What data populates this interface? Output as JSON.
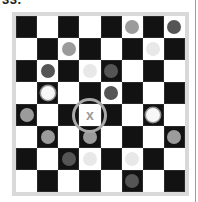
{
  "puzzle": {
    "title": "33.",
    "target_mark": "x",
    "target_cell": {
      "row": 4,
      "col": 3
    }
  },
  "colors": {
    "dark_square": "#121212",
    "light_square": "#ffffff",
    "frame": "#d9d9d9",
    "piece_mid_gray": "#9b9b9b",
    "piece_dark_gray": "#555555",
    "piece_light_gray": "#e8e8e8",
    "piece_white": "#f7f7f7",
    "target_ring": "#a9a9a9"
  },
  "board": {
    "rows": 8,
    "cols": 8,
    "pieces": [
      {
        "row": 0,
        "col": 5,
        "type": "mid"
      },
      {
        "row": 0,
        "col": 7,
        "type": "darkp"
      },
      {
        "row": 1,
        "col": 2,
        "type": "mid"
      },
      {
        "row": 1,
        "col": 6,
        "type": "lightp"
      },
      {
        "row": 2,
        "col": 1,
        "type": "darkp"
      },
      {
        "row": 2,
        "col": 3,
        "type": "lightp"
      },
      {
        "row": 2,
        "col": 4,
        "type": "darkp"
      },
      {
        "row": 3,
        "col": 1,
        "type": "white"
      },
      {
        "row": 3,
        "col": 4,
        "type": "darkp"
      },
      {
        "row": 4,
        "col": 0,
        "type": "mid"
      },
      {
        "row": 4,
        "col": 6,
        "type": "white"
      },
      {
        "row": 5,
        "col": 1,
        "type": "mid"
      },
      {
        "row": 5,
        "col": 3,
        "type": "mid"
      },
      {
        "row": 5,
        "col": 7,
        "type": "mid"
      },
      {
        "row": 6,
        "col": 2,
        "type": "darkp"
      },
      {
        "row": 6,
        "col": 3,
        "type": "lightp"
      },
      {
        "row": 6,
        "col": 5,
        "type": "lightp"
      },
      {
        "row": 7,
        "col": 5,
        "type": "darkp"
      }
    ]
  }
}
